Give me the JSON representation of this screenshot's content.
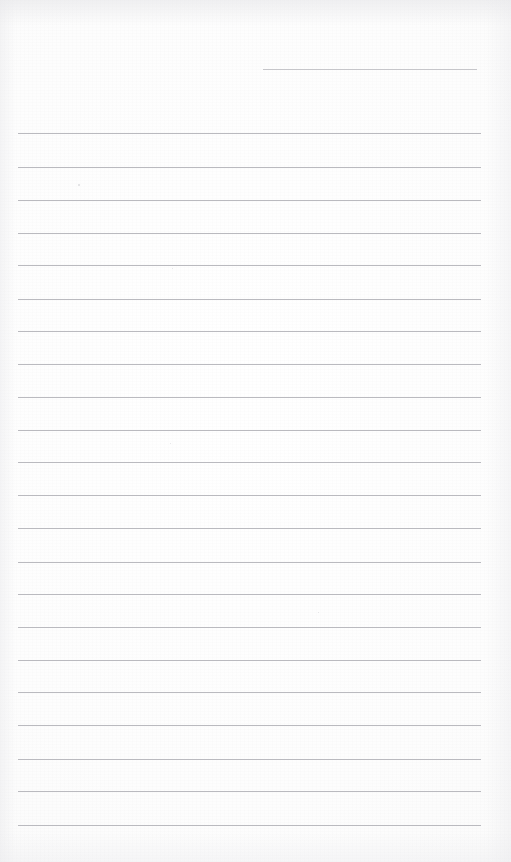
{
  "document": {
    "kind": "scanned-blank-lined-paper",
    "title": "Blank Lined Paper",
    "description": "Scanned blank sheet of ruled writing paper with no handwriting or printed text",
    "page_width": 511,
    "page_height": 862,
    "text_content": "",
    "visible_text_present": false
  },
  "paper": {
    "background_color": "#fefefe",
    "tone_color": "#fafafa",
    "edge_shadow_color": "#e8e8eb"
  },
  "ruling": {
    "line_color": "#b4b4ba",
    "line_thickness_px": 1,
    "line_spacing_px": 32.4,
    "left_margin_px": 18,
    "right_margin_px": 480,
    "full_line_count": 22,
    "partial_line_count": 1,
    "first_line_y": 133,
    "last_line_y": 825
  },
  "lines": [
    {
      "id": "line-partial-top",
      "y": 69,
      "x1": 263,
      "x2": 477,
      "full_width": false,
      "faint": true
    },
    {
      "id": "line-01",
      "y": 133,
      "x1": 18,
      "x2": 481,
      "full_width": true,
      "faint": false
    },
    {
      "id": "line-02",
      "y": 167,
      "x1": 18,
      "x2": 481,
      "full_width": true,
      "faint": false
    },
    {
      "id": "line-03",
      "y": 200,
      "x1": 18,
      "x2": 481,
      "full_width": true,
      "faint": false
    },
    {
      "id": "line-04",
      "y": 233,
      "x1": 18,
      "x2": 481,
      "full_width": true,
      "faint": false
    },
    {
      "id": "line-05",
      "y": 265,
      "x1": 18,
      "x2": 481,
      "full_width": true,
      "faint": false
    },
    {
      "id": "line-06",
      "y": 299,
      "x1": 18,
      "x2": 481,
      "full_width": true,
      "faint": false
    },
    {
      "id": "line-07",
      "y": 331,
      "x1": 18,
      "x2": 481,
      "full_width": true,
      "faint": false
    },
    {
      "id": "line-08",
      "y": 364,
      "x1": 18,
      "x2": 481,
      "full_width": true,
      "faint": false
    },
    {
      "id": "line-09",
      "y": 397,
      "x1": 18,
      "x2": 481,
      "full_width": true,
      "faint": false
    },
    {
      "id": "line-10",
      "y": 430,
      "x1": 18,
      "x2": 481,
      "full_width": true,
      "faint": false
    },
    {
      "id": "line-11",
      "y": 462,
      "x1": 18,
      "x2": 481,
      "full_width": true,
      "faint": false
    },
    {
      "id": "line-12",
      "y": 495,
      "x1": 18,
      "x2": 481,
      "full_width": true,
      "faint": false
    },
    {
      "id": "line-13",
      "y": 528,
      "x1": 18,
      "x2": 481,
      "full_width": true,
      "faint": false
    },
    {
      "id": "line-14",
      "y": 562,
      "x1": 18,
      "x2": 481,
      "full_width": true,
      "faint": false
    },
    {
      "id": "line-15",
      "y": 594,
      "x1": 18,
      "x2": 481,
      "full_width": true,
      "faint": false
    },
    {
      "id": "line-16",
      "y": 627,
      "x1": 18,
      "x2": 481,
      "full_width": true,
      "faint": false
    },
    {
      "id": "line-17",
      "y": 660,
      "x1": 18,
      "x2": 481,
      "full_width": true,
      "faint": false
    },
    {
      "id": "line-18",
      "y": 692,
      "x1": 18,
      "x2": 481,
      "full_width": true,
      "faint": false
    },
    {
      "id": "line-19",
      "y": 725,
      "x1": 18,
      "x2": 481,
      "full_width": true,
      "faint": false
    },
    {
      "id": "line-20",
      "y": 759,
      "x1": 18,
      "x2": 481,
      "full_width": true,
      "faint": false
    },
    {
      "id": "line-21",
      "y": 791,
      "x1": 18,
      "x2": 481,
      "full_width": true,
      "faint": false
    },
    {
      "id": "line-22",
      "y": 825,
      "x1": 18,
      "x2": 481,
      "full_width": true,
      "faint": false
    }
  ],
  "specks": [
    {
      "id": "speck-1",
      "x": 78,
      "y": 184,
      "size": 1.5
    },
    {
      "id": "speck-2",
      "x": 172,
      "y": 268,
      "size": 1.2
    },
    {
      "id": "speck-3",
      "x": 170,
      "y": 443,
      "size": 1.4
    },
    {
      "id": "speck-4",
      "x": 318,
      "y": 612,
      "size": 1.1
    }
  ]
}
